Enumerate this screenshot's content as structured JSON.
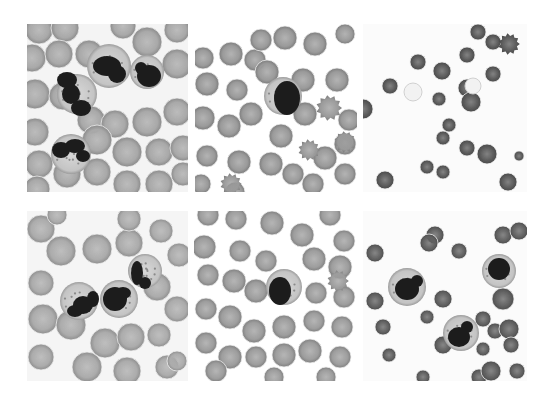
{
  "figure": {
    "layout": {
      "rows": 2,
      "cols": 3
    },
    "background": "#ffffff",
    "panels": [
      {
        "id": "top-left",
        "x": 27,
        "y": 24,
        "w": 161,
        "h": 168,
        "bg": "#f4f4f4",
        "rbc_fill": "#a9a9a9",
        "rbc_edge": "#8a8a8a",
        "content": "Densely packed RBCs with four segmented neutrophils (granular cytoplasm, lobed dark nuclei)",
        "rbcs": [
          [
            12,
            6,
            14
          ],
          [
            38,
            4,
            14
          ],
          [
            96,
            2,
            13
          ],
          [
            150,
            6,
            13
          ],
          [
            5,
            34,
            14
          ],
          [
            32,
            30,
            14
          ],
          [
            62,
            30,
            14
          ],
          [
            120,
            18,
            15
          ],
          [
            150,
            40,
            15
          ],
          [
            8,
            70,
            15
          ],
          [
            36,
            72,
            14
          ],
          [
            64,
            96,
            14
          ],
          [
            88,
            100,
            14
          ],
          [
            120,
            98,
            15
          ],
          [
            150,
            88,
            14
          ],
          [
            8,
            108,
            14
          ],
          [
            100,
            128,
            15
          ],
          [
            132,
            128,
            14
          ],
          [
            156,
            124,
            13
          ],
          [
            12,
            140,
            14
          ],
          [
            40,
            150,
            14
          ],
          [
            70,
            148,
            14
          ],
          [
            100,
            160,
            14
          ],
          [
            132,
            160,
            14
          ],
          [
            156,
            150,
            12
          ],
          [
            10,
            165,
            13
          ],
          [
            70,
            116,
            15
          ]
        ],
        "wbcs": [
          {
            "cx": 50,
            "cy": 70,
            "r": 20,
            "nucleus": [
              [
                40,
                56,
                10,
                8
              ],
              [
                44,
                70,
                9,
                10
              ],
              [
                54,
                84,
                10,
                8
              ]
            ]
          },
          {
            "cx": 82,
            "cy": 42,
            "r": 22,
            "nucleus": [
              [
                80,
                42,
                14,
                10
              ],
              [
                90,
                50,
                9,
                9
              ]
            ]
          },
          {
            "cx": 120,
            "cy": 48,
            "r": 17,
            "nucleus": [
              [
                122,
                52,
                12,
                11
              ],
              [
                114,
                44,
                6,
                6
              ]
            ]
          },
          {
            "cx": 44,
            "cy": 130,
            "r": 20,
            "nucleus": [
              [
                34,
                126,
                9,
                8
              ],
              [
                48,
                122,
                10,
                7
              ],
              [
                56,
                132,
                7,
                6
              ]
            ]
          }
        ]
      },
      {
        "id": "top-middle",
        "x": 195,
        "y": 24,
        "w": 162,
        "h": 168,
        "bg": "#ffffff",
        "rbc_fill": "#9a9a9a",
        "rbc_edge": "#7c7c7c",
        "content": "Spread RBCs with several echinocytes; single leukocyte with dark compact nucleus at center",
        "rbcs": [
          [
            8,
            34,
            11
          ],
          [
            36,
            30,
            12
          ],
          [
            60,
            36,
            11
          ],
          [
            90,
            14,
            12
          ],
          [
            120,
            20,
            12
          ],
          [
            150,
            10,
            10
          ],
          [
            12,
            60,
            12
          ],
          [
            42,
            66,
            11
          ],
          [
            72,
            48,
            12
          ],
          [
            108,
            56,
            12
          ],
          [
            142,
            56,
            12
          ],
          [
            8,
            94,
            12
          ],
          [
            34,
            102,
            12
          ],
          [
            56,
            90,
            12
          ],
          [
            86,
            112,
            12
          ],
          [
            110,
            90,
            12
          ],
          [
            130,
            134,
            12
          ],
          [
            154,
            96,
            11
          ],
          [
            12,
            132,
            11
          ],
          [
            44,
            138,
            12
          ],
          [
            76,
            140,
            12
          ],
          [
            98,
            150,
            11
          ],
          [
            118,
            160,
            11
          ],
          [
            150,
            150,
            11
          ],
          [
            150,
            120,
            11
          ],
          [
            66,
            16,
            11
          ],
          [
            6,
            160,
            10
          ],
          [
            40,
            168,
            10
          ]
        ],
        "spiky": [
          [
            134,
            84,
            12
          ],
          [
            114,
            126,
            10
          ],
          [
            36,
            160,
            10
          ],
          [
            150,
            118,
            10
          ]
        ],
        "wbcs": [
          {
            "cx": 88,
            "cy": 72,
            "r": 19,
            "nucleus": [
              [
                92,
                74,
                13,
                17
              ]
            ]
          }
        ]
      },
      {
        "id": "top-right",
        "x": 363,
        "y": 24,
        "w": 164,
        "h": 168,
        "bg": "#fbfbfb",
        "rbc_fill": "#5a5a5a",
        "rbc_edge": "#4a4a4a",
        "content": "Sparse dark RBCs and spherocytes on pale background; one crenated cell upper right",
        "rbcs": [
          [
            115,
            8,
            8
          ],
          [
            130,
            18,
            8
          ],
          [
            104,
            31,
            8
          ],
          [
            55,
            38,
            8
          ],
          [
            79,
            47,
            9
          ],
          [
            130,
            50,
            8
          ],
          [
            27,
            62,
            8
          ],
          [
            104,
            64,
            9
          ],
          [
            76,
            75,
            7
          ],
          [
            108,
            78,
            10
          ],
          [
            86,
            101,
            7
          ],
          [
            80,
            114,
            7
          ],
          [
            104,
            124,
            8
          ],
          [
            124,
            130,
            10
          ],
          [
            64,
            143,
            7
          ],
          [
            80,
            148,
            7
          ],
          [
            22,
            156,
            9
          ],
          [
            145,
            158,
            9
          ],
          [
            156,
            132,
            5
          ],
          [
            0,
            85,
            10
          ]
        ],
        "spiky": [
          [
            146,
            20,
            10
          ]
        ],
        "pale": [
          [
            50,
            68,
            9
          ],
          [
            110,
            62,
            8
          ]
        ],
        "wbcs": []
      },
      {
        "id": "bottom-left",
        "x": 27,
        "y": 211,
        "w": 161,
        "h": 170,
        "bg": "#f5f5f5",
        "rbc_fill": "#acacac",
        "rbc_edge": "#8e8e8e",
        "content": "Overlapping RBCs with three segmented neutrophils in center",
        "rbcs": [
          [
            14,
            18,
            14
          ],
          [
            34,
            40,
            15
          ],
          [
            70,
            38,
            15
          ],
          [
            102,
            32,
            14
          ],
          [
            134,
            20,
            12
          ],
          [
            152,
            44,
            12
          ],
          [
            14,
            72,
            13
          ],
          [
            130,
            76,
            14
          ],
          [
            150,
            98,
            13
          ],
          [
            16,
            108,
            15
          ],
          [
            44,
            114,
            15
          ],
          [
            78,
            132,
            15
          ],
          [
            104,
            126,
            14
          ],
          [
            132,
            124,
            12
          ],
          [
            14,
            146,
            13
          ],
          [
            60,
            156,
            15
          ],
          [
            100,
            160,
            14
          ],
          [
            140,
            156,
            12
          ],
          [
            150,
            150,
            10
          ],
          [
            102,
            8,
            12
          ],
          [
            30,
            4,
            10
          ]
        ],
        "wbcs": [
          {
            "cx": 52,
            "cy": 90,
            "r": 19,
            "nucleus": [
              [
                56,
                94,
                10,
                9
              ],
              [
                48,
                100,
                8,
                6
              ],
              [
                66,
                88,
                6,
                8
              ]
            ]
          },
          {
            "cx": 92,
            "cy": 88,
            "r": 19,
            "nucleus": [
              [
                88,
                88,
                12,
                12
              ],
              [
                96,
                82,
                8,
                6
              ]
            ]
          },
          {
            "cx": 118,
            "cy": 60,
            "r": 17,
            "nucleus": [
              [
                110,
                62,
                6,
                12
              ],
              [
                118,
                72,
                6,
                6
              ]
            ]
          }
        ]
      },
      {
        "id": "bottom-middle",
        "x": 194,
        "y": 211,
        "w": 163,
        "h": 170,
        "bg": "#ffffff",
        "rbc_fill": "#9d9d9d",
        "rbc_edge": "#808080",
        "content": "Closely packed RBCs with central pallor; single leukocyte with dark nucleus at center",
        "rbcs": [
          [
            14,
            4,
            11
          ],
          [
            42,
            8,
            11
          ],
          [
            78,
            12,
            12
          ],
          [
            108,
            24,
            12
          ],
          [
            136,
            4,
            11
          ],
          [
            150,
            30,
            11
          ],
          [
            10,
            36,
            12
          ],
          [
            46,
            40,
            11
          ],
          [
            72,
            50,
            11
          ],
          [
            120,
            48,
            12
          ],
          [
            146,
            56,
            12
          ],
          [
            14,
            64,
            11
          ],
          [
            40,
            70,
            12
          ],
          [
            62,
            80,
            12
          ],
          [
            122,
            82,
            11
          ],
          [
            150,
            86,
            11
          ],
          [
            12,
            98,
            11
          ],
          [
            36,
            106,
            12
          ],
          [
            60,
            120,
            12
          ],
          [
            90,
            116,
            12
          ],
          [
            120,
            110,
            11
          ],
          [
            148,
            116,
            11
          ],
          [
            12,
            132,
            11
          ],
          [
            36,
            146,
            12
          ],
          [
            62,
            146,
            11
          ],
          [
            90,
            144,
            12
          ],
          [
            116,
            140,
            12
          ],
          [
            146,
            146,
            11
          ],
          [
            22,
            160,
            11
          ],
          [
            80,
            166,
            10
          ],
          [
            132,
            166,
            10
          ]
        ],
        "spiky": [
          [
            144,
            70,
            10
          ]
        ],
        "wbcs": [
          {
            "cx": 90,
            "cy": 76,
            "r": 18,
            "nucleus": [
              [
                86,
                80,
                11,
                14
              ]
            ]
          }
        ]
      },
      {
        "id": "bottom-right",
        "x": 363,
        "y": 211,
        "w": 164,
        "h": 170,
        "bg": "#fbfbfb",
        "rbc_fill": "#606060",
        "rbc_edge": "#4e4e4e",
        "content": "Sparse RBCs with three leukocytes (band/segmented forms with horseshoe nuclei)",
        "rbcs": [
          [
            72,
            24,
            9
          ],
          [
            66,
            32,
            9
          ],
          [
            140,
            24,
            9
          ],
          [
            156,
            20,
            9
          ],
          [
            12,
            42,
            9
          ],
          [
            96,
            40,
            8
          ],
          [
            12,
            90,
            9
          ],
          [
            80,
            88,
            9
          ],
          [
            140,
            88,
            11
          ],
          [
            64,
            106,
            7
          ],
          [
            120,
            108,
            8
          ],
          [
            20,
            116,
            8
          ],
          [
            132,
            120,
            8
          ],
          [
            146,
            118,
            10
          ],
          [
            80,
            134,
            9
          ],
          [
            26,
            144,
            7
          ],
          [
            120,
            138,
            7
          ],
          [
            148,
            134,
            8
          ],
          [
            154,
            160,
            8
          ],
          [
            60,
            166,
            7
          ],
          [
            116,
            166,
            8
          ],
          [
            128,
            160,
            10
          ]
        ],
        "wbcs": [
          {
            "cx": 44,
            "cy": 76,
            "r": 19,
            "nucleus": [
              [
                44,
                78,
                12,
                11
              ],
              [
                54,
                70,
                6,
                6
              ]
            ]
          },
          {
            "cx": 98,
            "cy": 122,
            "r": 18,
            "nucleus": [
              [
                96,
                126,
                11,
                10
              ],
              [
                104,
                116,
                6,
                6
              ]
            ]
          },
          {
            "cx": 136,
            "cy": 60,
            "r": 17,
            "nucleus": [
              [
                136,
                58,
                11,
                11
              ]
            ]
          }
        ]
      }
    ]
  }
}
